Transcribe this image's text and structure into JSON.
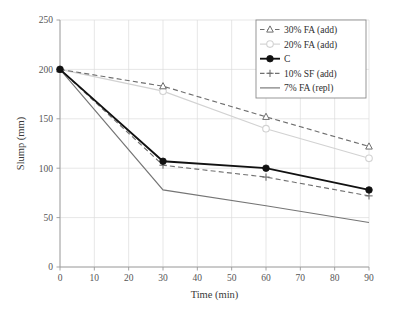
{
  "chart_data": {
    "type": "line",
    "title": "",
    "xlabel": "Time (min)",
    "ylabel": "Slump (mm)",
    "x": [
      0,
      30,
      60,
      90
    ],
    "xlim": [
      0,
      90
    ],
    "ylim": [
      0,
      250
    ],
    "xticks": [
      0,
      10,
      20,
      30,
      40,
      50,
      60,
      70,
      80,
      90
    ],
    "yticks": [
      0,
      50,
      100,
      150,
      200,
      250
    ],
    "xtick_labels": [
      "0",
      "10",
      "20",
      "30",
      "40",
      "50",
      "60",
      "70",
      "80",
      "90"
    ],
    "ytick_labels": [
      "0",
      "50",
      "100",
      "150",
      "200",
      "250"
    ],
    "grid": true,
    "legend_position": "top-right",
    "series": [
      {
        "name": "30% FA (add)",
        "values": [
          200,
          183,
          152,
          122
        ],
        "color": "#6e6e6e",
        "line_style": "dashed",
        "marker": "triangle"
      },
      {
        "name": "20% FA (add)",
        "values": [
          200,
          178,
          140,
          110
        ],
        "color": "#d2d2d2",
        "line_style": "solid",
        "marker": "circle-open"
      },
      {
        "name": "C",
        "values": [
          200,
          107,
          100,
          78
        ],
        "color": "#111111",
        "line_style": "solid",
        "marker": "circle-filled"
      },
      {
        "name": "10% SF (add)",
        "values": [
          200,
          103,
          91,
          72
        ],
        "color": "#707070",
        "line_style": "dashed",
        "marker": "plus"
      },
      {
        "name": "7% FA (repl)",
        "values": [
          200,
          78,
          62,
          45
        ],
        "color": "#757575",
        "line_style": "solid",
        "marker": "none"
      }
    ]
  }
}
